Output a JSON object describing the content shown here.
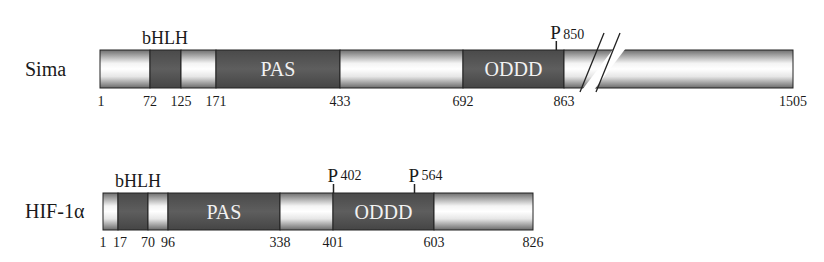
{
  "colors": {
    "domain_fill": "#585858",
    "light_fill_center": "#ffffff",
    "light_fill_edge": "#7a7a7a",
    "outline": "#222222",
    "domain_text": "#f2f2f2"
  },
  "proteins": [
    {
      "name": "Sima",
      "length": 1505,
      "has_break": true,
      "break_after": 863,
      "segments": [
        {
          "start": 1,
          "end": 72,
          "type": "light",
          "label": ""
        },
        {
          "start": 72,
          "end": 125,
          "type": "domain",
          "label": ""
        },
        {
          "start": 125,
          "end": 171,
          "type": "light",
          "label": ""
        },
        {
          "start": 171,
          "end": 433,
          "type": "domain",
          "label": "PAS"
        },
        {
          "start": 433,
          "end": 692,
          "type": "light",
          "label": ""
        },
        {
          "start": 692,
          "end": 863,
          "type": "domain",
          "label": "ODDD"
        },
        {
          "start": 863,
          "end": 1505,
          "type": "light",
          "label": ""
        }
      ],
      "header_label": "bHLH",
      "header_span": [
        72,
        125
      ],
      "position_labels": [
        "1",
        "72",
        "125",
        "171",
        "433",
        "692",
        "863",
        "1505"
      ],
      "prolines": [
        {
          "letter": "P",
          "position": "850"
        }
      ]
    },
    {
      "name": "HIF-1α",
      "length": 826,
      "has_break": false,
      "segments": [
        {
          "start": 1,
          "end": 17,
          "type": "light",
          "label": ""
        },
        {
          "start": 17,
          "end": 70,
          "type": "domain",
          "label": ""
        },
        {
          "start": 70,
          "end": 96,
          "type": "light",
          "label": ""
        },
        {
          "start": 96,
          "end": 338,
          "type": "domain",
          "label": "PAS"
        },
        {
          "start": 338,
          "end": 401,
          "type": "light",
          "label": ""
        },
        {
          "start": 401,
          "end": 603,
          "type": "domain",
          "label": "ODDD"
        },
        {
          "start": 603,
          "end": 826,
          "type": "light",
          "label": ""
        }
      ],
      "header_label": "bHLH",
      "header_span": [
        17,
        96
      ],
      "position_labels": [
        "1",
        "17",
        "70",
        "96",
        "338",
        "401",
        "603",
        "826"
      ],
      "prolines": [
        {
          "letter": "P",
          "position": "402"
        },
        {
          "letter": "P",
          "position": "564"
        }
      ]
    }
  ]
}
